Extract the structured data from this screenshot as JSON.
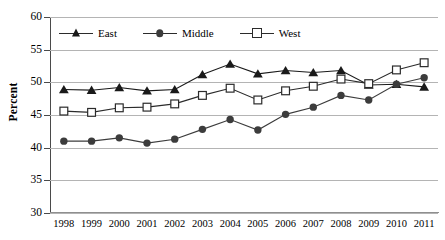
{
  "chart_data": {
    "type": "line",
    "title": "",
    "subtitle": "",
    "xlabel": "",
    "ylabel": "Percent",
    "ylim": [
      30,
      60
    ],
    "ytick_values": [
      30,
      35,
      40,
      45,
      50,
      55,
      60
    ],
    "ytick_labels": [
      "30",
      "35",
      "40",
      "45",
      "50",
      "55",
      "60"
    ],
    "grid": true,
    "grid_axis": "y",
    "legend_position": "top-left-inside",
    "categories": [
      1998,
      1999,
      2000,
      2001,
      2002,
      2003,
      2004,
      2005,
      2006,
      2007,
      2008,
      2009,
      2010,
      2011
    ],
    "xtick_labels": [
      "1998",
      "1999",
      "2000",
      "2001",
      "2002",
      "2003",
      "2004",
      "2005",
      "2006",
      "2007",
      "2008",
      "2009",
      "2010",
      "2011"
    ],
    "series": [
      {
        "name": "East",
        "marker": "filled-triangle",
        "color": "#1a1a1a",
        "values": [
          48.9,
          48.8,
          49.2,
          48.7,
          48.9,
          51.2,
          52.8,
          51.3,
          51.8,
          51.5,
          51.8,
          49.6,
          49.7,
          49.3
        ]
      },
      {
        "name": "Middle",
        "marker": "filled-circle",
        "color": "#3c3c3c",
        "values": [
          41.0,
          41.0,
          41.5,
          40.7,
          41.3,
          42.8,
          44.3,
          42.7,
          45.1,
          46.2,
          48.0,
          47.3,
          49.7,
          50.7
        ]
      },
      {
        "name": "West",
        "marker": "open-square",
        "color": "#2b2b2b",
        "values": [
          45.6,
          45.4,
          46.1,
          46.2,
          46.7,
          48.0,
          49.1,
          47.3,
          48.7,
          49.4,
          50.5,
          49.8,
          51.9,
          53.0
        ]
      }
    ],
    "annotations": []
  },
  "legend": {
    "items": [
      {
        "label": "East",
        "marker": "filled-triangle"
      },
      {
        "label": "Middle",
        "marker": "filled-circle"
      },
      {
        "label": "West",
        "marker": "open-square"
      }
    ]
  },
  "colors": {
    "background": "#ffffff",
    "gridline": "#b4b4b4",
    "axis": "#4a4a4a",
    "text": "#000000",
    "series_east": "#1a1a1a",
    "series_middle": "#3c3c3c",
    "series_west": "#2b2b2b"
  }
}
